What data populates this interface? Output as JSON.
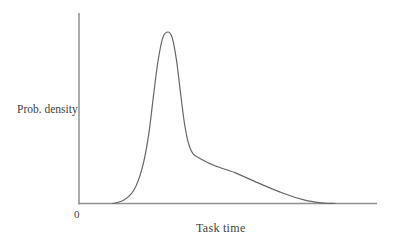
{
  "chart_data": {
    "type": "line",
    "title": "",
    "xlabel": "Task time",
    "ylabel": "Prob. density",
    "x_tick_labels": [
      "0"
    ],
    "y_tick_labels": [],
    "xlim": [
      0,
      10
    ],
    "ylim": [
      0,
      1.05
    ],
    "grid": false,
    "legend": "none",
    "series": [
      {
        "name": "task-time-probability-density",
        "shape": "right-skewed unimodal density (log-normal-like)",
        "points": [
          [
            1.14,
            0.0
          ],
          [
            1.51,
            0.02
          ],
          [
            1.85,
            0.08
          ],
          [
            2.11,
            0.2
          ],
          [
            2.32,
            0.38
          ],
          [
            2.48,
            0.6
          ],
          [
            2.65,
            0.83
          ],
          [
            2.82,
            0.97
          ],
          [
            2.99,
            1.0
          ],
          [
            3.12,
            0.97
          ],
          [
            3.26,
            0.85
          ],
          [
            3.39,
            0.67
          ],
          [
            3.52,
            0.49
          ],
          [
            3.66,
            0.36
          ],
          [
            3.83,
            0.29
          ],
          [
            4.09,
            0.26
          ],
          [
            4.56,
            0.22
          ],
          [
            5.23,
            0.18
          ],
          [
            6.01,
            0.12
          ],
          [
            6.85,
            0.06
          ],
          [
            7.58,
            0.02
          ],
          [
            8.15,
            0.004
          ],
          [
            8.59,
            0.0
          ]
        ]
      }
    ],
    "colors": {
      "curve": "#666666",
      "axis": "#919191",
      "text": "#3f3f3f"
    }
  }
}
